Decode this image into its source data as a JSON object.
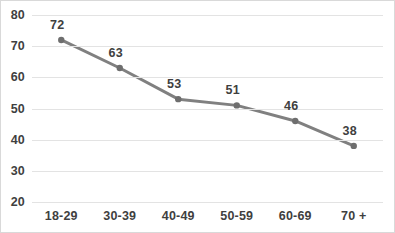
{
  "chart_data": {
    "type": "line",
    "title": "",
    "xlabel": "",
    "ylabel": "",
    "categories": [
      "18-29",
      "30-39",
      "40-49",
      "50-59",
      "60-69",
      "70 +"
    ],
    "values": [
      72,
      63,
      53,
      51,
      46,
      38
    ],
    "data_labels": [
      "72",
      "63",
      "53",
      "51",
      "46",
      "38"
    ],
    "series": [
      {
        "name": "Series 1",
        "values": [
          72,
          63,
          53,
          51,
          46,
          38
        ]
      }
    ],
    "ylim": [
      20,
      80
    ],
    "ytick_step": 10,
    "ytick_labels": [
      "80",
      "70",
      "60",
      "50",
      "40",
      "30",
      "20"
    ],
    "ytick_values": [
      80,
      70,
      60,
      50,
      40,
      30,
      20
    ],
    "grid": "horizontal",
    "legend": "none",
    "colors": {
      "line": "#808080",
      "marker": "#6e6e6e",
      "gridline": "#e3e3e3",
      "text": "#3f3f3f",
      "border": "#d9d9d9",
      "background": "#ffffff"
    }
  }
}
